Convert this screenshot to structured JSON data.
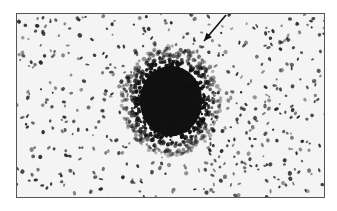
{
  "figure": {
    "frame": {
      "x": 16,
      "y": 13,
      "width": 309,
      "height": 185,
      "border_color": "#555555",
      "background": "#f4f4f4"
    },
    "cluster": {
      "cx": 154,
      "cy": 87,
      "rx": 40,
      "ry": 44,
      "color": "#111111"
    },
    "arrow": {
      "x1": 209,
      "y1": 1,
      "x2": 187,
      "y2": 27,
      "color": "#111111"
    },
    "speckle_color": "#2a2a2a",
    "speckle_count": 520,
    "seed": 7
  }
}
